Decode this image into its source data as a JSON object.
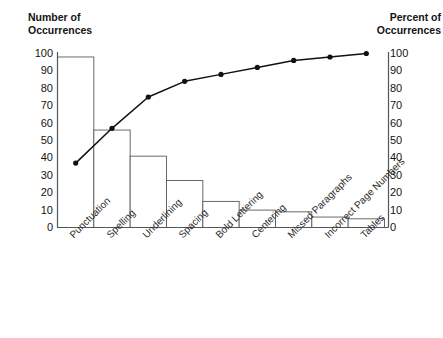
{
  "axes": {
    "left_title": "Number of\nOccurrences",
    "right_title": "Percent of\nOccurrences"
  },
  "chart_data": {
    "type": "bar",
    "title": "",
    "subtitle": "",
    "xlabel": "",
    "ylabel": "Number of Occurrences",
    "y2label": "Percent of Occurrences",
    "ylim": [
      0,
      100
    ],
    "y2lim": [
      0,
      100
    ],
    "ytick_labels": [
      "100",
      "90",
      "80",
      "70",
      "60",
      "50",
      "40",
      "30",
      "20",
      "10",
      "0"
    ],
    "y2tick_labels": [
      "100",
      "90",
      "80",
      "70",
      "60",
      "50",
      "40",
      "30",
      "20",
      "10",
      "0"
    ],
    "yticks": [
      100,
      90,
      80,
      70,
      60,
      50,
      40,
      30,
      20,
      10,
      0
    ],
    "y2ticks": [
      100,
      90,
      80,
      70,
      60,
      50,
      40,
      30,
      20,
      10,
      0
    ],
    "grid": false,
    "legend": false,
    "legend_position": "none",
    "categories": [
      "Punctuation",
      "Spelling",
      "Underlining",
      "Spacing",
      "Bold Lettering",
      "Centering",
      "Missed Paragraphs",
      "Incorrect Page Numbers",
      "Tables"
    ],
    "series": [
      {
        "name": "Number of Occurrences",
        "kind": "bar",
        "axis": "left",
        "values": [
          98,
          56,
          41,
          27,
          15,
          10,
          9,
          6,
          5
        ]
      },
      {
        "name": "Cumulative Percent of Occurrences",
        "kind": "line",
        "axis": "right",
        "values": [
          37,
          57,
          75,
          84,
          88,
          92,
          96,
          98,
          100
        ]
      }
    ],
    "bar_fill": "#ffffff",
    "bar_stroke": "#5a5a5a",
    "line_color": "#111111",
    "marker": "circle",
    "marker_color": "#111111",
    "axis_color": "#555555"
  }
}
